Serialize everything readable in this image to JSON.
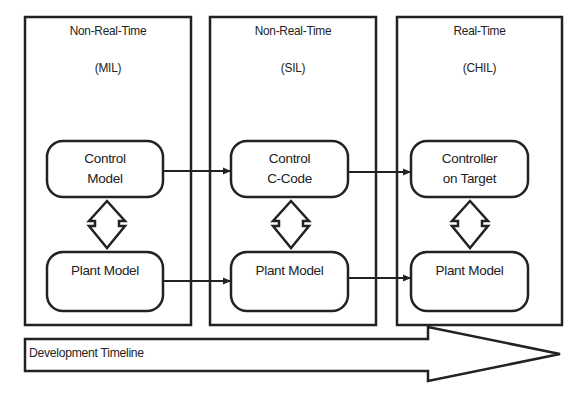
{
  "columns": [
    {
      "id": "mil",
      "mode": "Non-Real-Time",
      "abbrev": "(MIL)",
      "controller_box": {
        "line1": "Control",
        "line2": "Model"
      },
      "plant_box": {
        "label": "Plant Model"
      }
    },
    {
      "id": "sil",
      "mode": "Non-Real-Time",
      "abbrev": "(SIL)",
      "controller_box": {
        "line1": "Control",
        "line2": "C-Code"
      },
      "plant_box": {
        "label": "Plant Model"
      }
    },
    {
      "id": "chil",
      "mode": "Real-Time",
      "abbrev": "(CHIL)",
      "controller_box": {
        "line1": "Controller",
        "line2": "on Target"
      },
      "plant_box": {
        "label": "Plant Model"
      }
    }
  ],
  "timeline": {
    "label": "Development Timeline"
  },
  "colors": {
    "stroke": "#222222",
    "background": "#ffffff"
  }
}
